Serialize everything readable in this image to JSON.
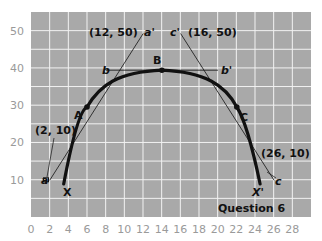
{
  "chart_data": {
    "type": "line",
    "title": "Question 6",
    "xlabel": "",
    "ylabel": "",
    "xlim": [
      0,
      30
    ],
    "ylim": [
      0,
      55
    ],
    "grid": true,
    "background": "#a9a9a9",
    "grid_color": "#ffffff",
    "x_ticks": [
      0,
      2,
      4,
      6,
      8,
      10,
      12,
      14,
      16,
      18,
      20,
      22,
      24,
      26,
      28
    ],
    "y_ticks": [
      10,
      20,
      30,
      40,
      50
    ],
    "series": [
      {
        "name": "curve XBX'",
        "style": "thick",
        "color": "#111111",
        "points": [
          [
            3.5,
            9
          ],
          [
            4.5,
            16
          ],
          [
            6,
            25
          ],
          [
            8,
            32
          ],
          [
            10,
            37
          ],
          [
            12,
            39.5
          ],
          [
            14,
            40
          ],
          [
            16,
            39.5
          ],
          [
            18,
            37
          ],
          [
            20,
            32
          ],
          [
            22,
            25
          ],
          [
            23.5,
            16
          ],
          [
            24.5,
            9
          ]
        ]
      },
      {
        "name": "tangent a-a'",
        "style": "thin",
        "color": "#111111",
        "points": [
          [
            2,
            10
          ],
          [
            12,
            50
          ]
        ]
      },
      {
        "name": "tangent b-b'",
        "style": "thin",
        "color": "#111111",
        "points": [
          [
            8,
            40
          ],
          [
            20,
            40
          ]
        ]
      },
      {
        "name": "tangent c'-c",
        "style": "thin",
        "color": "#111111",
        "points": [
          [
            16,
            50
          ],
          [
            26,
            10
          ]
        ]
      }
    ],
    "points": [
      {
        "label": "A",
        "x": 6,
        "y": 25
      },
      {
        "label": "B",
        "x": 14,
        "y": 40
      },
      {
        "label": "C",
        "x": 22,
        "y": 25
      }
    ],
    "annotations": [
      {
        "text": "(12, 50)",
        "x": 12,
        "y": 50
      },
      {
        "text": "a'",
        "x": 12,
        "y": 50
      },
      {
        "text": "c'",
        "x": 16,
        "y": 50
      },
      {
        "text": "(16, 50)",
        "x": 16,
        "y": 50
      },
      {
        "text": "b",
        "x": 8,
        "y": 40
      },
      {
        "text": "b'",
        "x": 20,
        "y": 40
      },
      {
        "text": "(2, 10)",
        "x": 2,
        "y": 10
      },
      {
        "text": "a",
        "x": 2,
        "y": 10
      },
      {
        "text": "(26, 10)",
        "x": 26,
        "y": 10
      },
      {
        "text": "c",
        "x": 26,
        "y": 10
      },
      {
        "text": "X",
        "x": 3.5,
        "y": 9
      },
      {
        "text": "X'",
        "x": 24.5,
        "y": 9
      }
    ]
  },
  "labels": {
    "title": "Question 6",
    "point_a": "A",
    "point_b": "B",
    "point_c": "C",
    "coord_12_50": "(12, 50)",
    "coord_16_50": "(16, 50)",
    "coord_2_10": "(2, 10)",
    "coord_26_10": "(26, 10)",
    "a_prime": "a'",
    "c_prime": "c'",
    "b": "b",
    "b_prime": "b'",
    "a": "a",
    "c": "c",
    "x_start": "X",
    "x_end": "X'"
  },
  "y_tick_labels": [
    "10",
    "20",
    "30",
    "40",
    "50"
  ],
  "x_tick_labels": [
    "0",
    "2",
    "4",
    "6",
    "8",
    "10",
    "12",
    "14",
    "16",
    "18",
    "20",
    "22",
    "24",
    "26",
    "28"
  ]
}
